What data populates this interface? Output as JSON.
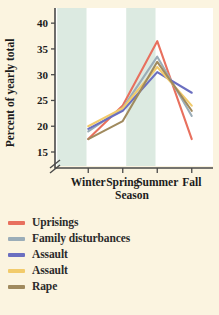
{
  "chart_data": {
    "type": "line",
    "title": "",
    "xlabel": "Season",
    "ylabel": "Percent of yearly total",
    "categories": [
      "Winter",
      "Spring",
      "Summer",
      "Fall"
    ],
    "ylim": [
      15,
      41
    ],
    "yticks": [
      15,
      20,
      25,
      30,
      35,
      40
    ],
    "axis_break": true,
    "grid": false,
    "legend_position": "below",
    "shaded_bands": [
      "Winter",
      "Summer"
    ],
    "series": [
      {
        "name": "Uprisings",
        "color": "#e8705e",
        "values": [
          17.5,
          24.0,
          36.5,
          17.5
        ]
      },
      {
        "name": "Family disturbances",
        "color": "#9badb8",
        "values": [
          19.0,
          23.5,
          33.5,
          22.0
        ]
      },
      {
        "name": "Assault",
        "color": "#6b6fc0",
        "values": [
          19.5,
          23.0,
          30.5,
          26.5
        ]
      },
      {
        "name": "Assault",
        "color": "#f2cb6b",
        "values": [
          20.0,
          23.5,
          31.5,
          24.0
        ]
      },
      {
        "name": "Rape",
        "color": "#a08a5e",
        "values": [
          17.5,
          21.0,
          32.5,
          23.0
        ]
      }
    ]
  },
  "legend": {
    "items": [
      {
        "label": "Uprisings",
        "color": "#e8705e"
      },
      {
        "label": "Family disturbances",
        "color": "#9badb8"
      },
      {
        "label": "Assault",
        "color": "#6b6fc0"
      },
      {
        "label": "Assault",
        "color": "#f2cb6b"
      },
      {
        "label": "Rape",
        "color": "#a08a5e"
      }
    ]
  },
  "colors": {
    "page_background": "#fbf4e0",
    "plot_background": "#ffffff",
    "band": "#dceae1",
    "axis": "#4a4a4a",
    "text": "#1c1c1c"
  }
}
